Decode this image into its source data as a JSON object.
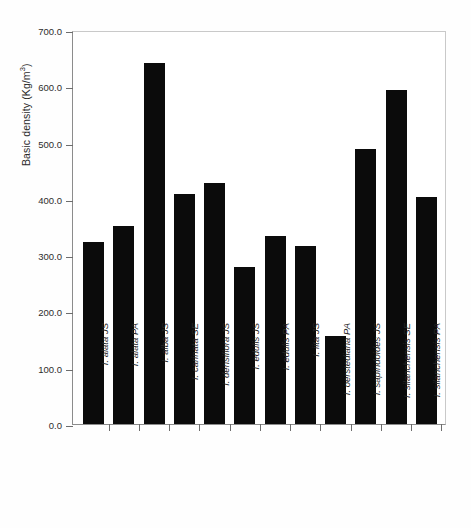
{
  "figure": {
    "background_color": "#ffffff",
    "bar_color": "#0b0b0b",
    "axis_color": "#6d6d6d",
    "frame_color": "#c9c9c9"
  },
  "axes": {
    "y_title_main": "Basic density (Kg/m",
    "y_title_sup": "3",
    "y_title_tail": ")",
    "y_title_full": "Basic density (Kg/m3)",
    "y_ticks": [
      "700.0",
      "600.0",
      "500.0",
      "400.0",
      "300.0",
      "200.0",
      "100.0",
      "0.0"
    ],
    "y_min": 0,
    "y_max": 700,
    "y_step": 100
  },
  "chart_data": {
    "type": "bar",
    "title": "",
    "xlabel": "",
    "ylabel": "Basic density (Kg/m3)",
    "ylim": [
      0,
      700
    ],
    "grid": false,
    "legend": "none",
    "orientation": "vertical",
    "categories": [
      "I. alata JS",
      "I. alata PA",
      "I. alba JS",
      "I. carinata SE",
      "I. densiflora JS",
      "I. edulis JS",
      "I. edulis PA",
      "I. iita JS",
      "I. oerstediana PA",
      "I. sapindoides JS",
      "I. silanchensis SE",
      "I. silanchensis PA"
    ],
    "values": [
      324,
      352,
      642,
      409,
      429,
      279,
      334,
      317,
      156,
      488,
      594,
      404
    ]
  }
}
